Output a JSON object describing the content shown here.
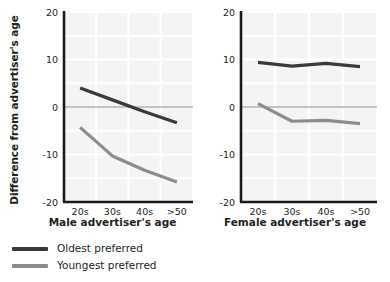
{
  "chart_data": {
    "type": "line",
    "title": "",
    "ylabel": "Difference from advertiser's age",
    "categories": [
      "20s",
      "30s",
      "40s",
      ">50"
    ],
    "ylim": [
      -20,
      20
    ],
    "yticks": [
      20,
      10,
      0,
      -10,
      -20
    ],
    "ytick_labels": [
      "20",
      "10",
      "0",
      "-10",
      "-20"
    ],
    "grid": true,
    "legend_position": "bottom-left",
    "zero_line": true,
    "panels": [
      {
        "id": "male",
        "xlabel": "Male advertiser's age",
        "series": [
          {
            "name": "Oldest preferred",
            "color": "#3a3a3a",
            "values": [
              4.0,
              1.5,
              -1.0,
              -3.3
            ]
          },
          {
            "name": "Youngest preferred",
            "color": "#8c8c8c",
            "values": [
              -4.3,
              -10.3,
              -13.3,
              -15.8
            ]
          }
        ]
      },
      {
        "id": "female",
        "xlabel": "Female advertiser's age",
        "series": [
          {
            "name": "Oldest preferred",
            "color": "#3a3a3a",
            "values": [
              9.4,
              8.6,
              9.2,
              8.5
            ]
          },
          {
            "name": "Youngest preferred",
            "color": "#8c8c8c",
            "values": [
              0.7,
              -3.0,
              -2.8,
              -3.5
            ]
          }
        ]
      }
    ],
    "legend": [
      {
        "label": "Oldest preferred",
        "color": "#3a3a3a"
      },
      {
        "label": "Youngest preferred",
        "color": "#8c8c8c"
      }
    ],
    "colors": {
      "plot_background": "#f4f4f4",
      "gridline": "#ffffff",
      "axis": "#1a1a1a",
      "zero_line": "#7a7a7a",
      "text": "#231f20"
    }
  }
}
